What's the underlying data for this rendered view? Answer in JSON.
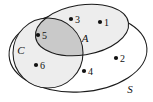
{
  "figure": {
    "type": "venn-diagram",
    "title": "",
    "universe_label": "S",
    "sets": [
      {
        "id": "A",
        "label": "A",
        "shape": "ellipse",
        "fill": "#ededed"
      },
      {
        "id": "C",
        "label": "C",
        "shape": "circle",
        "fill": "#ededed"
      }
    ],
    "intersection_fill": "#c9c9c9",
    "background": "#ffffff",
    "stroke": "#1b1b1b",
    "elements": [
      {
        "label": "1",
        "region": "A-only"
      },
      {
        "label": "2",
        "region": "S-only"
      },
      {
        "label": "3",
        "region": "A-only"
      },
      {
        "label": "4",
        "region": "S-only"
      },
      {
        "label": "5",
        "region": "A-and-C"
      },
      {
        "label": "6",
        "region": "C-only"
      }
    ]
  }
}
